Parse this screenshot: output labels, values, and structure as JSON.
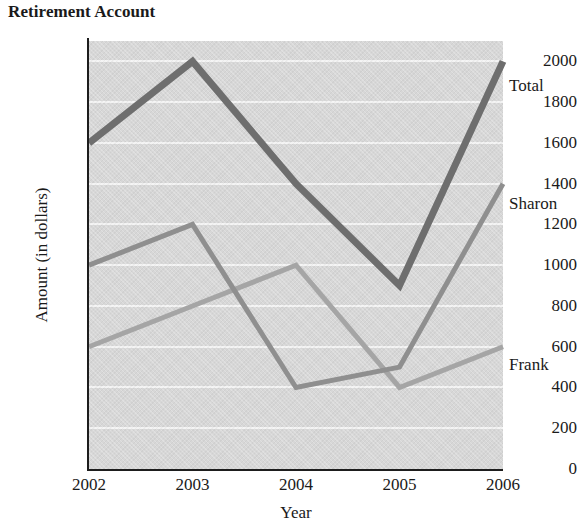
{
  "chart_data": {
    "type": "line",
    "title": "Retirement Account",
    "xlabel": "Year",
    "ylabel": "Amount (in dollars)",
    "categories": [
      "2002",
      "2003",
      "2004",
      "2005",
      "2006"
    ],
    "x": [
      2002,
      2003,
      2004,
      2005,
      2006
    ],
    "xlim": [
      2002,
      2006
    ],
    "ylim": [
      0,
      2100
    ],
    "yticks": [
      0,
      200,
      400,
      600,
      800,
      1000,
      1200,
      1400,
      1600,
      1800,
      2000
    ],
    "ytick_labels": [
      "0",
      "200",
      "400",
      "600",
      "800",
      "1000",
      "1200",
      "1400",
      "1600",
      "1800",
      "2000"
    ],
    "grid": true,
    "grid_color": "#f3f3f3",
    "plot_background": "#d7d7d7",
    "legend_position": "right-inline-labels",
    "series": [
      {
        "name": "Total",
        "values": [
          1600,
          2000,
          1400,
          900,
          2000
        ],
        "color": "#6e6e6e",
        "line_width": 7,
        "label_x": 509,
        "label_y": 76
      },
      {
        "name": "Sharon",
        "values": [
          1000,
          1200,
          400,
          500,
          1400
        ],
        "color": "#8f8f8f",
        "line_width": 5,
        "label_x": 509,
        "label_y": 194
      },
      {
        "name": "Frank",
        "values": [
          600,
          800,
          1000,
          400,
          600
        ],
        "color": "#a5a5a5",
        "line_width": 5,
        "label_x": 509,
        "label_y": 355
      }
    ]
  }
}
